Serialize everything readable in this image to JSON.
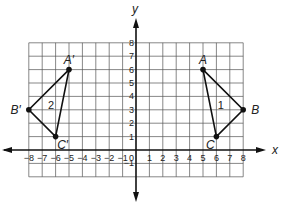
{
  "axes": {
    "x_label": "x",
    "y_label": "y",
    "x_range": [
      -8,
      8
    ],
    "y_range": [
      -2,
      8
    ],
    "origin_label": "0",
    "x_ticks": [
      "-8",
      "-7",
      "-6",
      "-5",
      "-4",
      "-3",
      "-2",
      "-1",
      "1",
      "2",
      "3",
      "4",
      "5",
      "6",
      "7",
      "8"
    ],
    "y_ticks": [
      "8",
      "7",
      "6",
      "5",
      "4",
      "3",
      "2",
      "1",
      "-1"
    ]
  },
  "figures": [
    {
      "id": "1",
      "label": "1",
      "vertices": [
        {
          "name": "A",
          "x": 5,
          "y": 6
        },
        {
          "name": "B",
          "x": 8,
          "y": 3
        },
        {
          "name": "C",
          "x": 6,
          "y": 1
        }
      ]
    },
    {
      "id": "2",
      "label": "2",
      "vertices": [
        {
          "name": "A′",
          "x": -5,
          "y": 6
        },
        {
          "name": "B′",
          "x": -8,
          "y": 3
        },
        {
          "name": "C′",
          "x": -6,
          "y": 1
        }
      ]
    }
  ]
}
